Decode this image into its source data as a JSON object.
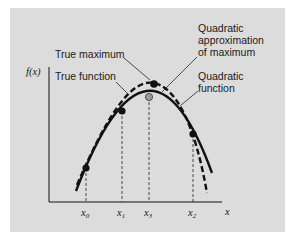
{
  "figure": {
    "background": "#dcdcdc",
    "y_axis_label": "f(x)",
    "x_axis_label": "x",
    "x_ticks": [
      {
        "base": "x",
        "sub": "0"
      },
      {
        "base": "x",
        "sub": "1"
      },
      {
        "base": "x",
        "sub": "3"
      },
      {
        "base": "x",
        "sub": "2"
      }
    ],
    "annotations": {
      "true_maximum": "True maximum",
      "true_function": "True function",
      "quad_approx_line1": "Quadratic",
      "quad_approx_line2": "approximation",
      "quad_approx_line3": "of maximum",
      "quad_function_line1": "Quadratic",
      "quad_function_line2": "function"
    },
    "points": {
      "true_max_color": "#111111",
      "quad_max_color": "#9a9a9a",
      "sample_color": "#111111"
    }
  }
}
